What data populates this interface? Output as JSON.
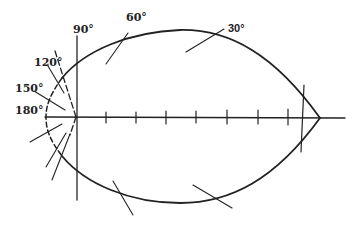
{
  "diagram": {
    "type": "polar-curve",
    "angle_labels": [
      "90°",
      "60°",
      "30°",
      "120°",
      "150°",
      "180°"
    ],
    "axis_tick_count": 7,
    "colors": {
      "line": "#222222",
      "background": "#ffffff"
    }
  }
}
